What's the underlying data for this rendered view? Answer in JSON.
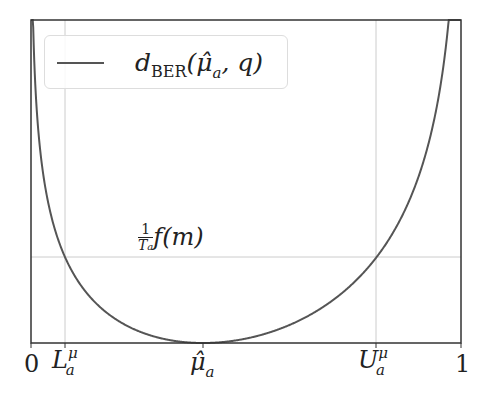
{
  "chart_data": {
    "type": "line",
    "title": "",
    "xlabel": "",
    "ylabel": "",
    "xlim": [
      0,
      1
    ],
    "grid": false,
    "legend_position": "upper left",
    "series": [
      {
        "name": "d_BER(μ̂_a, q)",
        "description": "Bernoulli KL divergence from μ̂_a to q",
        "mu_hat": 0.4,
        "color": "#555555"
      }
    ],
    "x_ticks": [
      {
        "value": 0,
        "label": "0"
      },
      {
        "value": 0.079,
        "label": "L_a^μ"
      },
      {
        "value": 0.4,
        "label": "μ̂_a"
      },
      {
        "value": 0.8,
        "label": "U_a^μ"
      },
      {
        "value": 1,
        "label": "1"
      }
    ],
    "reference_lines": [
      {
        "orientation": "horizontal",
        "label": "(1/T_a) f(m)"
      },
      {
        "orientation": "vertical",
        "x": 0.079,
        "label": "L_a^μ"
      },
      {
        "orientation": "vertical",
        "x": 0.8,
        "label": "U_a^μ"
      }
    ],
    "annotations": [
      {
        "text": "(1/T_a) f(m)",
        "position": "above horizontal threshold line"
      }
    ]
  },
  "legend": {
    "symbol": "d",
    "subscript": "BER",
    "args": "(μ̂",
    "args_sub": "a",
    "args_tail": ", q)"
  },
  "labels": {
    "zero": "0",
    "one": "1",
    "L": "L",
    "L_sup": "μ",
    "L_sub": "a",
    "mu": "μ̂",
    "mu_sub": "a",
    "U": "U",
    "U_sup": "μ",
    "U_sub": "a",
    "thresh_num": "1",
    "thresh_den": "T",
    "thresh_den_sub": "a",
    "thresh_fn": "f(m)"
  }
}
